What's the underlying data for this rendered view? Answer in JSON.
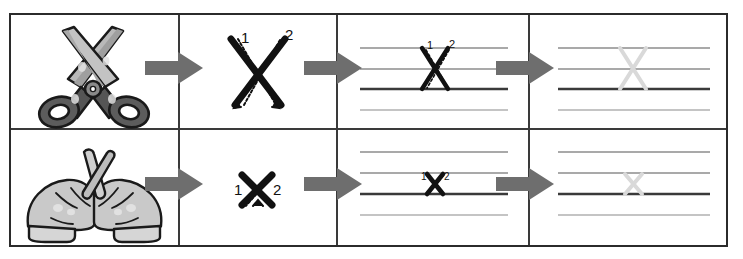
{
  "page": {
    "background": "#ffffff",
    "frame_color": "#2b2b2b",
    "arrow_color": "#6e6e6e"
  },
  "palette": {
    "guideline_light": "#8d8d8d",
    "guideline_baseline": "#3a3a3a",
    "guideline_descender": "#b0b0b0",
    "ghost_letter": "#d9d9d9",
    "stroke_black": "#111111",
    "scissors_handle": "#5a5a5a",
    "scissors_blade": "#b8b8b8",
    "hand_fill": "#c9c9c9",
    "hand_outline": "#1a1a1a"
  },
  "columns": [
    {
      "key": "tool",
      "label": "Tool"
    },
    {
      "key": "stroke",
      "label": "Stroke order"
    },
    {
      "key": "onlines",
      "label": "On writing lines"
    },
    {
      "key": "trace",
      "label": "Trace the ghost letter"
    }
  ],
  "rows": [
    {
      "id": "uppercase-x",
      "label": "Uppercase X",
      "cells": [
        {
          "name": "scissors-illustration",
          "caption": "scissors"
        },
        {
          "name": "uppercase-x-stroke-diagram",
          "caption": "X",
          "stroke_numbers": [
            "1",
            "2"
          ],
          "stroke_count": 2
        },
        {
          "name": "uppercase-x-on-lines",
          "caption": "X on lines",
          "stroke_numbers": [
            "1",
            "2"
          ],
          "guideline_count": 4
        },
        {
          "name": "uppercase-x-trace",
          "caption": "X ghost trace",
          "guideline_count": 4
        }
      ]
    },
    {
      "id": "lowercase-x",
      "label": "Lowercase x",
      "cells": [
        {
          "name": "crossed-fingers-illustration",
          "caption": "crossed fingers"
        },
        {
          "name": "lowercase-x-stroke-diagram",
          "caption": "x",
          "stroke_numbers": [
            "1",
            "2"
          ],
          "stroke_count": 2
        },
        {
          "name": "lowercase-x-on-lines",
          "caption": "x on lines",
          "stroke_numbers": [
            "1",
            "2"
          ],
          "guideline_count": 4
        },
        {
          "name": "lowercase-x-trace",
          "caption": "x ghost trace",
          "guideline_count": 4
        }
      ]
    }
  ],
  "arrows": [
    {
      "name": "arrow-row1-1",
      "direction": "right"
    },
    {
      "name": "arrow-row1-2",
      "direction": "right"
    },
    {
      "name": "arrow-row1-3",
      "direction": "right"
    },
    {
      "name": "arrow-row2-1",
      "direction": "right"
    },
    {
      "name": "arrow-row2-2",
      "direction": "right"
    },
    {
      "name": "arrow-row2-3",
      "direction": "right"
    }
  ],
  "stroke_labels": {
    "one": "1",
    "two": "2"
  }
}
